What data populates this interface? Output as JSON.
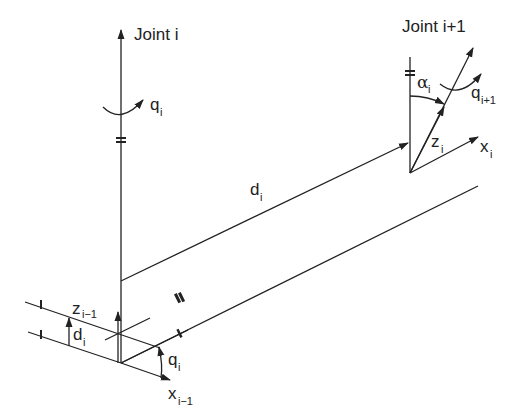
{
  "diagram": {
    "type": "Denavit-Hartenberg link parameters",
    "labels": {
      "joint_i": "Joint i",
      "joint_i1": "Joint i+1",
      "q_i_top": {
        "base": "q",
        "sub": "i"
      },
      "q_i1": {
        "base": "q",
        "sub": "i+1"
      },
      "alpha_i": {
        "base": "α",
        "sub": "i"
      },
      "z_i": {
        "base": "z",
        "sub": "i"
      },
      "x_i": {
        "base": "x",
        "sub": "i"
      },
      "d_i_link": {
        "base": "d",
        "sub": "i"
      },
      "z_i_1": {
        "base": "z",
        "sub": "i−1"
      },
      "d_i_offset": {
        "base": "d",
        "sub": "i"
      },
      "q_i_bottom": {
        "base": "q",
        "sub": "i"
      },
      "x_i_1": {
        "base": "x",
        "sub": "i−1"
      }
    },
    "line_color": "#222222",
    "background": "#ffffff"
  }
}
